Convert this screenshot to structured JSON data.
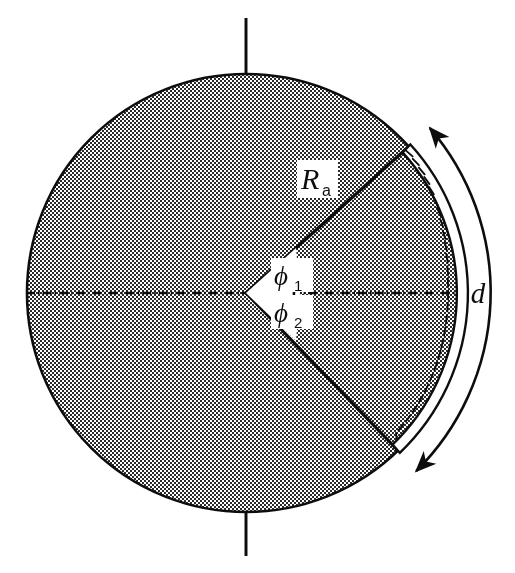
{
  "figure": {
    "name": "circular-sector-diagram",
    "background_color": "#ffffff",
    "ink_color": "#111111",
    "fill_color": "#8c8c8c",
    "fill_pattern": "checkerboard-dither-50"
  },
  "labels": {
    "radius": {
      "base": "R",
      "subscript": "a",
      "full": "Ra"
    },
    "angle_upper": {
      "base": "ϕ",
      "subscript": "1",
      "full": "ϕ1"
    },
    "angle_lower": {
      "base": "ϕ",
      "subscript": "2",
      "full": "ϕ2"
    },
    "arc_dimension": {
      "base": "d",
      "full": "d"
    }
  },
  "geometry": {
    "center_x": 246,
    "center_y": 293,
    "radius": 219,
    "angle_upper_deg": 42,
    "angle_lower_deg": 46,
    "band_thickness": 9,
    "arrow_arc_radius": 252
  },
  "elements": {
    "disk": "shaded-disk",
    "vertical_axis": "vertical-centerline",
    "horizontal_axis": "horizontal-centerline-dash-dot",
    "sector_upper_radius": "sector-radius-upper",
    "sector_lower_radius": "sector-radius-lower",
    "hatched_band": "outer-hatched-band",
    "dimension_arc": "double-headed-arc-arrow"
  }
}
